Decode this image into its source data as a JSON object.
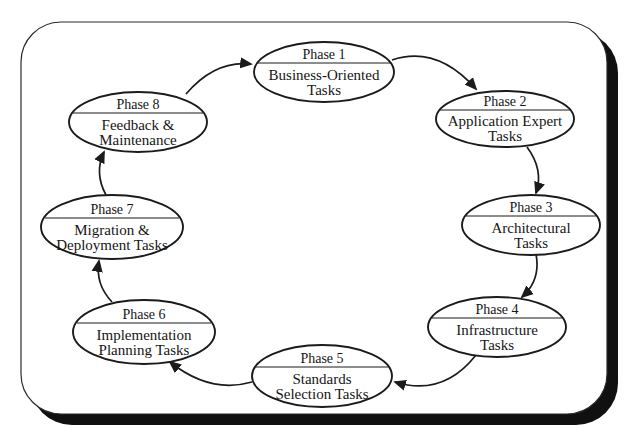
{
  "figure": {
    "type": "cycle-diagram",
    "phases": [
      {
        "label": "Phase 1",
        "line1": "Business-Oriented",
        "line2": "Tasks"
      },
      {
        "label": "Phase 2",
        "line1": "Application Expert",
        "line2": "Tasks"
      },
      {
        "label": "Phase 3",
        "line1": "Architectural",
        "line2": "Tasks"
      },
      {
        "label": "Phase 4",
        "line1": "Infrastructure",
        "line2": "Tasks"
      },
      {
        "label": "Phase 5",
        "line1": "Standards",
        "line2": "Selection Tasks"
      },
      {
        "label": "Phase 6",
        "line1": "Implementation",
        "line2": "Planning Tasks"
      },
      {
        "label": "Phase 7",
        "line1": "Migration &",
        "line2": "Deployment Tasks"
      },
      {
        "label": "Phase 8",
        "line1": "Feedback &",
        "line2": "Maintenance"
      }
    ],
    "flow_order": [
      "Phase 1",
      "Phase 2",
      "Phase 3",
      "Phase 4",
      "Phase 5",
      "Phase 6",
      "Phase 7",
      "Phase 8",
      "Phase 1"
    ],
    "flow_direction": "clockwise"
  },
  "colors": {
    "ink": "#1b1b1b",
    "frame_shadow": "#101010",
    "paper": "#ffffff"
  }
}
